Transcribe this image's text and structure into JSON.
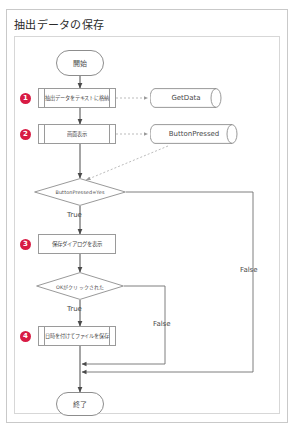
{
  "document": {
    "title": "抽出データの保存"
  },
  "flowchart": {
    "type": "flowchart",
    "start": {
      "label": "開始",
      "shape": "terminator"
    },
    "end": {
      "label": "終了",
      "shape": "terminator"
    },
    "steps": [
      {
        "number": "1",
        "label": "抽出データをテキストに格納",
        "shape": "process"
      },
      {
        "number": "2",
        "label": "画面表示",
        "shape": "process"
      },
      {
        "number": "3",
        "label": "保存ダイアログを表示",
        "shape": "process"
      },
      {
        "number": "4",
        "label": "日時を付けてファイルを保存",
        "shape": "process"
      }
    ],
    "decisions": [
      {
        "label": "ButtonPressed=Yes",
        "shape": "diamond",
        "true_label": "True",
        "false_label": "False"
      },
      {
        "label": "OKがクリックされた",
        "shape": "diamond",
        "true_label": "True",
        "false_label": "False"
      }
    ],
    "datastores": [
      {
        "label": "GetData",
        "shape": "cylinder"
      },
      {
        "label": "ButtonPressed",
        "shape": "cylinder"
      }
    ],
    "edge_labels": {
      "true_1": "True",
      "true_2": "True",
      "false_1": "False",
      "false_2": "False"
    },
    "colors": {
      "badge": "#d81b44",
      "stroke": "#8d8d8d",
      "text": "#4a4a4a",
      "frame": "#d7d7d7",
      "card": "#c9c9c9"
    }
  }
}
